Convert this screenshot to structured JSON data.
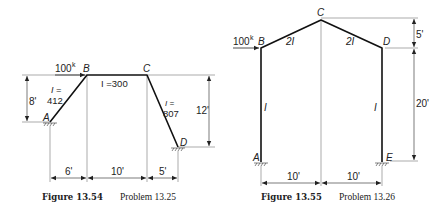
{
  "figures": [
    {
      "id": "fig1",
      "caption_number": "Figure 13.54",
      "caption_problem": "Problem 13.25",
      "load": "100",
      "load_unit": "k",
      "joints": {
        "A": "A",
        "B": "B",
        "C": "C",
        "D": "D"
      },
      "members": {
        "AB": {
          "label_1": "I =",
          "label_2": "412"
        },
        "BC": {
          "label": "I =300"
        },
        "CD": {
          "label_1": "I =",
          "label_2": "807"
        }
      },
      "dimensions": {
        "left_height": "8'",
        "right_height": "12'",
        "span_1": "6'",
        "span_2": "10'",
        "span_3": "5'"
      }
    },
    {
      "id": "fig2",
      "caption_number": "Figure 13.55",
      "caption_problem": "Problem 13.26",
      "load": "100",
      "load_unit": "k",
      "joints": {
        "A": "A",
        "B": "B",
        "C": "C",
        "D": "D",
        "E": "E"
      },
      "members": {
        "AB": {
          "label": "I"
        },
        "BC": {
          "label": "2I"
        },
        "CD": {
          "label": "2I"
        },
        "DE": {
          "label": "I"
        }
      },
      "dimensions": {
        "rise": "5'",
        "column_height": "20'",
        "span_1": "10'",
        "span_2": "10'"
      }
    }
  ]
}
